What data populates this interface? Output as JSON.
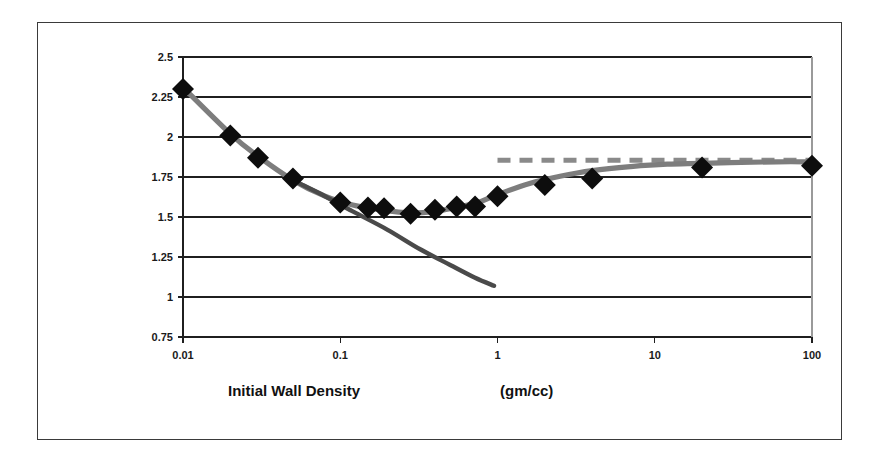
{
  "figure": {
    "frame_border_color": "#3a3a3a",
    "background_color": "#ffffff"
  },
  "axis_titles": {
    "x_main": "Initial Wall Density",
    "x_units": "(gm/cc)"
  },
  "chart_data": {
    "type": "scatter",
    "title": "",
    "subtitle": "",
    "xlabel": "Initial Wall Density        (gm/cc)",
    "ylabel": "",
    "xscale": "log",
    "yscale": "linear",
    "xlim": [
      0.01,
      100
    ],
    "ylim": [
      0.75,
      2.5
    ],
    "grid": true,
    "grid_axis": "y",
    "legend": false,
    "legend_position": "none",
    "x_tick_labels": [
      "0.01",
      "0.1",
      "1",
      "10",
      "100"
    ],
    "x_tick_values": [
      0.01,
      0.1,
      1,
      10,
      100
    ],
    "y_tick_labels": [
      "2.5",
      "2.25",
      "2",
      "1.75",
      "1.5",
      "1.25",
      "1",
      "0.75"
    ],
    "y_tick_values": [
      2.5,
      2.25,
      2,
      1.75,
      1.5,
      1.25,
      1,
      0.75
    ],
    "series": [
      {
        "name": "data-markers",
        "type": "scatter",
        "marker": "diamond",
        "color": "#0d0d0d",
        "x": [
          0.01,
          0.02,
          0.03,
          0.05,
          0.1,
          0.15,
          0.19,
          0.28,
          0.4,
          0.55,
          0.72,
          1.0,
          2.0,
          4.0,
          20.0,
          100.0
        ],
        "y": [
          2.3,
          2.01,
          1.87,
          1.74,
          1.59,
          1.56,
          1.555,
          1.52,
          1.545,
          1.565,
          1.565,
          1.63,
          1.7,
          1.74,
          1.81,
          1.82
        ]
      },
      {
        "name": "fitted-curve",
        "type": "line",
        "style": "solid",
        "color": "#7d7d7d",
        "x": [
          0.01,
          0.02,
          0.03,
          0.05,
          0.08,
          0.12,
          0.18,
          0.28,
          0.4,
          0.55,
          0.75,
          1.0,
          1.6,
          2.5,
          4.0,
          7.0,
          12.0,
          30.0,
          60.0,
          100.0
        ],
        "y": [
          2.31,
          2.02,
          1.88,
          1.73,
          1.63,
          1.575,
          1.545,
          1.525,
          1.535,
          1.56,
          1.59,
          1.64,
          1.71,
          1.755,
          1.79,
          1.815,
          1.83,
          1.84,
          1.845,
          1.845
        ]
      },
      {
        "name": "descending-branch",
        "type": "line",
        "style": "solid",
        "color": "#4a4a4a",
        "x": [
          0.055,
          0.08,
          0.12,
          0.2,
          0.32,
          0.5,
          0.72,
          0.95
        ],
        "y": [
          1.71,
          1.63,
          1.535,
          1.42,
          1.3,
          1.2,
          1.12,
          1.07
        ]
      },
      {
        "name": "asymptote",
        "type": "line",
        "style": "dashed",
        "color": "#8a8a8a",
        "x": [
          1.0,
          100.0
        ],
        "y": [
          1.855,
          1.855
        ]
      }
    ]
  }
}
